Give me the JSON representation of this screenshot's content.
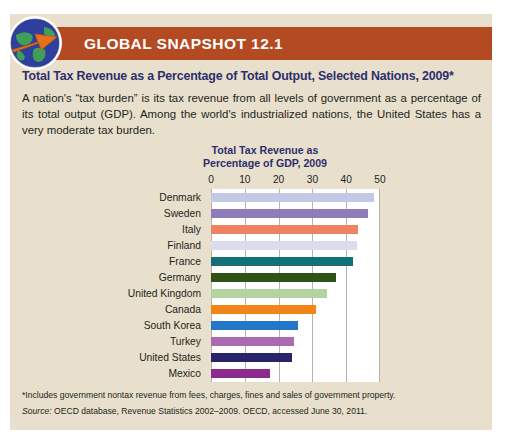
{
  "header": {
    "band_title": "GLOBAL SNAPSHOT 12.1",
    "band_color": "#b44a21",
    "icon": "globe-arrow-icon"
  },
  "panel": {
    "background_color": "#e8e0cc"
  },
  "snapshot": {
    "title": "Total Tax Revenue as a Percentage of Total Output, Selected Nations, 2009*",
    "title_color": "#2c2f6b",
    "body": "A nation's “tax burden” is its tax revenue from all levels of government as a percentage of its total output (GDP). Among the world's industrialized nations, the United States has a very moderate tax burden."
  },
  "footer": {
    "footnote": "*Includes government nontax revenue from fees, charges, fines and sales of government property.",
    "source_label": "Source:",
    "source_text": " OECD database, Revenue Statistics 2002–2009. OECD, accessed June 30, 2011."
  },
  "chart_data": {
    "type": "bar",
    "orientation": "horizontal",
    "title": "Total Tax Revenue as\nPercentage of GDP, 2009",
    "title_line1": "Total Tax Revenue as",
    "title_line2": "Percentage of GDP, 2009",
    "xlabel": "",
    "ylabel": "",
    "xlim": [
      0,
      50
    ],
    "ticks": [
      0,
      10,
      20,
      30,
      40,
      50
    ],
    "grid": true,
    "legend": "none",
    "categories": [
      "Denmark",
      "Sweden",
      "Italy",
      "Finland",
      "France",
      "Germany",
      "United Kingdom",
      "Canada",
      "South Korea",
      "Turkey",
      "United States",
      "Mexico"
    ],
    "values": [
      48.2,
      46.4,
      43.5,
      43.1,
      41.9,
      37.0,
      34.3,
      31.1,
      25.6,
      24.6,
      24.0,
      17.5
    ],
    "colors": [
      "#c3cae6",
      "#8e7cb8",
      "#ef8263",
      "#dbdcee",
      "#147077",
      "#2d5318",
      "#b3d4a0",
      "#f28518",
      "#2277c8",
      "#ab6bb0",
      "#27246b",
      "#8e2a8e"
    ]
  }
}
